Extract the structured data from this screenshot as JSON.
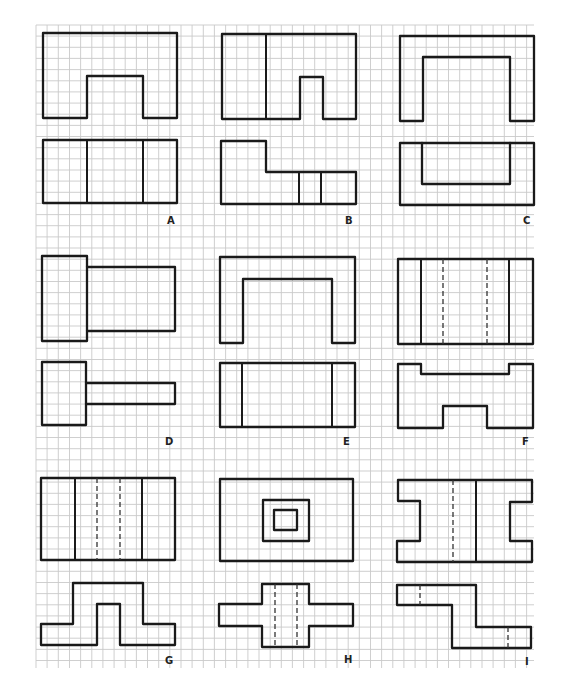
{
  "figure": {
    "grid": {
      "x0": 36,
      "y0": 25,
      "x1": 534,
      "y1": 668,
      "pitch": 11.15,
      "line_color": "#c9c9c9"
    },
    "stroke_color": "#1a1a1a",
    "panels": [
      {
        "id": "A",
        "label": "A",
        "label_pos": [
          167,
          215
        ],
        "paths": [
          "M43 33 L177 33 L177 118 L143 118 L143 76 L87 76 L87 118 L43 118 Z",
          "M43 140 L177 140 L177 203 L43 203 Z"
        ],
        "solid_lines": [
          [
            87,
            140,
            87,
            203
          ],
          [
            143,
            140,
            143,
            203
          ]
        ],
        "dashed_lines": []
      },
      {
        "id": "B",
        "label": "B",
        "label_pos": [
          345,
          215
        ],
        "paths": [
          "M222 34 L356 34 L356 119 L323 119 L323 77 L300 77 L300 119 L222 119 Z",
          "M221 141 L266 141 L266 172 L356 172 L356 204 L221 204 Z"
        ],
        "solid_lines": [
          [
            266,
            34,
            266,
            119
          ],
          [
            299,
            172,
            299,
            204
          ],
          [
            321,
            172,
            321,
            204
          ]
        ],
        "dashed_lines": []
      },
      {
        "id": "C",
        "label": "C",
        "label_pos": [
          523,
          215
        ],
        "paths": [
          "M400 36 L534 36 L534 121 L510 121 L510 57 L423 57 L423 121 L400 121 Z",
          "M400 143 L534 143 L534 205 L400 205 Z",
          "M422 143 L422 184 L510 184 L510 143"
        ],
        "solid_lines": [],
        "dashed_lines": []
      },
      {
        "id": "D",
        "label": "D",
        "label_pos": [
          165,
          436
        ],
        "paths": [
          "M42 256 L87 256 L87 341 L42 341 Z",
          "M87 267 L175 267 L175 331 L87 331",
          "M42 362 L86 362 L86 425 L42 425 Z",
          "M86 383 L175 383 L175 404 L86 404"
        ],
        "solid_lines": [],
        "dashed_lines": []
      },
      {
        "id": "E",
        "label": "E",
        "label_pos": [
          343,
          436
        ],
        "paths": [
          "M220 257 L355 257 L355 343 L332 343 L332 279 L243 279 L243 343 L220 343 Z",
          "M220 363 L355 363 L355 427 L220 427 Z"
        ],
        "solid_lines": [
          [
            242,
            363,
            242,
            427
          ],
          [
            332,
            363,
            332,
            427
          ]
        ],
        "dashed_lines": []
      },
      {
        "id": "F",
        "label": "F",
        "label_pos": [
          522,
          436
        ],
        "paths": [
          "M398 259 L533 259 L533 344 L398 344 Z",
          "M398 364 L421 364 L421 374 L509 374 L509 364 L533 364 L533 428 L487 428 L487 406 L443 406 L443 428 L398 428 Z"
        ],
        "solid_lines": [
          [
            421,
            259,
            421,
            344
          ],
          [
            509,
            259,
            509,
            344
          ]
        ],
        "dashed_lines": [
          [
            443,
            259,
            443,
            344
          ],
          [
            487,
            259,
            487,
            344
          ]
        ]
      },
      {
        "id": "G",
        "label": "G",
        "label_pos": [
          165,
          655
        ],
        "paths": [
          "M41 478 L175 478 L175 560 L41 560 Z",
          "M41 624 L73 624 L73 583 L143 583 L143 624 L175 624 L175 645 L120 645 L120 604 L97 604 L97 645 L41 645 Z"
        ],
        "solid_lines": [
          [
            75,
            478,
            75,
            560
          ],
          [
            142,
            478,
            142,
            560
          ]
        ],
        "dashed_lines": [
          [
            97,
            478,
            97,
            560
          ],
          [
            120,
            478,
            120,
            560
          ]
        ]
      },
      {
        "id": "H",
        "label": "H",
        "label_pos": [
          344,
          654
        ],
        "paths": [
          "M220 479 L353 479 L353 561 L220 561 Z",
          "M263 500 L309 500 L309 541 L263 541 Z",
          "M274 510 L297 510 L297 530 L274 530 Z",
          "M262 584 L309 584 L309 604 L353 604 L353 626 L309 626 L309 647 L262 647 L262 626 L219 626 L219 604 L262 604 Z"
        ],
        "solid_lines": [],
        "dashed_lines": [
          [
            275,
            584,
            275,
            647
          ],
          [
            297,
            584,
            297,
            647
          ]
        ]
      },
      {
        "id": "I",
        "label": "I",
        "label_pos": [
          525,
          656
        ],
        "paths": [
          "M398 480 L532 480 L532 502 L510 502 L510 541 L532 541 L532 562 L397 562 L397 541 L420 541 L420 501 L398 501 Z",
          "M397 585 L476 585 L476 627 L531 627 L531 648 L452 648 L452 605 L397 605 Z"
        ],
        "solid_lines": [
          [
            476,
            480,
            476,
            562
          ]
        ],
        "dashed_lines": [
          [
            453,
            480,
            453,
            562
          ],
          [
            420,
            585,
            420,
            605
          ],
          [
            508,
            627,
            508,
            648
          ]
        ]
      }
    ]
  }
}
